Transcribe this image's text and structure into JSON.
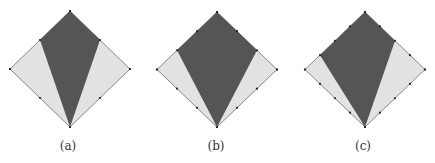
{
  "colors": {
    "outer_fill": "#e2e2e2",
    "kite_fill": "#555555",
    "stroke": "#888888",
    "dot": "#222222"
  },
  "panels": [
    {
      "label": "(a)",
      "cx": 70,
      "top": 11,
      "bottom": 127,
      "left": 10,
      "right": 130,
      "divisions": 2,
      "kite_left_frac": 0.5,
      "kite_right_frac": 0.5
    },
    {
      "label": "(b)",
      "cx": 217,
      "top": 12,
      "bottom": 127,
      "left": 157,
      "right": 277,
      "divisions": 3,
      "kite_left_frac": 0.6667,
      "kite_right_frac": 0.6667
    },
    {
      "label": "(c)",
      "cx": 365,
      "top": 12,
      "bottom": 127,
      "left": 305,
      "right": 425,
      "divisions": 4,
      "kite_left_frac": 0.75,
      "kite_right_frac": 0.5
    }
  ]
}
